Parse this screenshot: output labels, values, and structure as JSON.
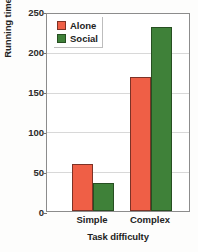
{
  "chart_data": {
    "type": "bar",
    "title": "",
    "xlabel": "Task difficulty",
    "ylabel": "Running time",
    "categories": [
      "Simple",
      "Complex"
    ],
    "series": [
      {
        "name": "Alone",
        "color": "#ef5f46",
        "values": [
          60,
          170
        ]
      },
      {
        "name": "Social",
        "color": "#3f8139",
        "values": [
          35,
          233
        ]
      }
    ],
    "ylim": [
      0,
      250
    ],
    "yticks": [
      0,
      50,
      100,
      150,
      200,
      250
    ],
    "ytick_labels": [
      "0",
      "50",
      "100",
      "150",
      "200",
      "250"
    ],
    "grid": true,
    "legend_position": "top-left"
  },
  "axes": {
    "y_title": "Running time",
    "x_title": "Task difficulty",
    "y_tick_0": "0",
    "y_tick_1": "50",
    "y_tick_2": "100",
    "y_tick_3": "150",
    "y_tick_4": "200",
    "y_tick_5": "250",
    "x_tick_0": "Simple",
    "x_tick_1": "Complex"
  },
  "legend": {
    "entries": [
      {
        "label": "Alone",
        "color": "#ef5f46"
      },
      {
        "label": "Social",
        "color": "#3f8139"
      }
    ],
    "entry_0_label": "Alone",
    "entry_1_label": "Social"
  }
}
